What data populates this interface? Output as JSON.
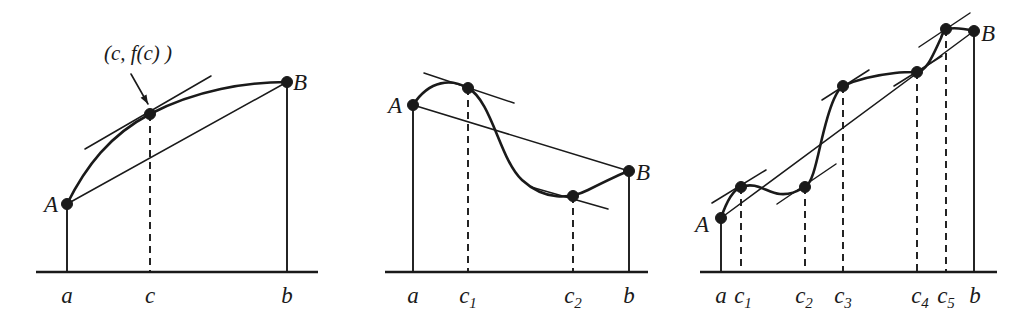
{
  "figure": {
    "background_color": "#ffffff",
    "ink_color": "#1a1a1a",
    "panels": [
      {
        "id": "panel-1",
        "name": "single-tangent-point",
        "annotation": {
          "text": "(c, f(c) )",
          "x": 138,
          "y": 60
        },
        "point_labels": [
          {
            "name": "A",
            "text": "A",
            "x": 51,
            "y": 212
          },
          {
            "name": "B",
            "text": "B",
            "x": 300,
            "y": 90
          }
        ],
        "axis_labels": [
          {
            "name": "a",
            "text": "a",
            "x": 67,
            "y": 303
          },
          {
            "name": "c",
            "text": "c",
            "x": 150,
            "y": 303
          },
          {
            "name": "b",
            "text": "b",
            "x": 287,
            "y": 303
          }
        ],
        "axis": {
          "x1": 36,
          "x2": 318,
          "y": 272
        },
        "verticals": [
          {
            "name": "a",
            "x": 67,
            "y_top": 204,
            "dashed": false
          },
          {
            "name": "c",
            "x": 150,
            "y_top": 114,
            "dashed": true
          },
          {
            "name": "b",
            "x": 287,
            "y_top": 82,
            "dashed": false
          }
        ],
        "points": [
          {
            "name": "A",
            "x": 67,
            "y": 204,
            "r": 5.5
          },
          {
            "name": "tangent-point-c",
            "x": 150,
            "y": 114,
            "r": 5.5
          },
          {
            "name": "B",
            "x": 287,
            "y": 82,
            "r": 5.5
          }
        ],
        "curve": "M 67 204 C 86 166 110 135 150 114 C 196 90 247 82 287 82",
        "secant": {
          "x1": 67,
          "y1": 204,
          "x2": 287,
          "y2": 82
        },
        "tangents": [
          {
            "name": "tangent-at-c",
            "x1": 85,
            "y1": 149,
            "x2": 211,
            "y2": 76
          }
        ],
        "arrow": {
          "x1": 131,
          "y1": 74,
          "x2": 148,
          "y2": 104
        }
      },
      {
        "id": "panel-2",
        "name": "two-tangent-points",
        "point_labels": [
          {
            "name": "A",
            "text": "A",
            "x": 395,
            "y": 113
          },
          {
            "name": "B",
            "text": "B",
            "x": 643,
            "y": 180
          }
        ],
        "axis_labels": [
          {
            "name": "a",
            "text": "a",
            "x": 413,
            "y": 303
          },
          {
            "name": "c1",
            "text": "c",
            "sub": "1",
            "x": 468,
            "y": 303
          },
          {
            "name": "c2",
            "text": "c",
            "sub": "2",
            "x": 573,
            "y": 303
          },
          {
            "name": "b",
            "text": "b",
            "x": 629,
            "y": 303
          }
        ],
        "axis": {
          "x1": 385,
          "x2": 648,
          "y": 272
        },
        "verticals": [
          {
            "name": "a",
            "x": 413,
            "y_top": 105,
            "dashed": false
          },
          {
            "name": "c1",
            "x": 468,
            "y_top": 88,
            "dashed": true
          },
          {
            "name": "c2",
            "x": 573,
            "y_top": 196,
            "dashed": true
          },
          {
            "name": "b",
            "x": 629,
            "y_top": 171,
            "dashed": false
          }
        ],
        "points": [
          {
            "name": "A",
            "x": 413,
            "y": 105,
            "r": 5.5
          },
          {
            "name": "tangent-point-c1",
            "x": 468,
            "y": 88,
            "r": 5.5
          },
          {
            "name": "tangent-point-c2",
            "x": 573,
            "y": 196,
            "r": 5.5
          },
          {
            "name": "B",
            "x": 629,
            "y": 171,
            "r": 5.5
          }
        ],
        "curve": "M 413 105 C 430 79 452 79 468 88 C 492 101 500 160 522 180 C 545 201 570 199 588 190 C 608 180 620 174 629 171",
        "secant": {
          "x1": 413,
          "y1": 105,
          "x2": 629,
          "y2": 171
        },
        "tangents": [
          {
            "name": "tangent-at-c1",
            "x1": 424,
            "y1": 73,
            "x2": 514,
            "y2": 103
          },
          {
            "name": "tangent-at-c2",
            "x1": 531,
            "y1": 187,
            "x2": 608,
            "y2": 209
          }
        ]
      },
      {
        "id": "panel-3",
        "name": "five-tangent-points",
        "point_labels": [
          {
            "name": "A",
            "text": "A",
            "x": 702,
            "y": 232
          },
          {
            "name": "B",
            "text": "B",
            "x": 988,
            "y": 41
          }
        ],
        "axis_labels": [
          {
            "name": "a",
            "text": "a",
            "x": 721,
            "y": 303
          },
          {
            "name": "c1",
            "text": "c",
            "sub": "1",
            "x": 743,
            "y": 303
          },
          {
            "name": "c2",
            "text": "c",
            "sub": "2",
            "x": 804,
            "y": 303
          },
          {
            "name": "c3",
            "text": "c",
            "sub": "3",
            "x": 843,
            "y": 303
          },
          {
            "name": "c4",
            "text": "c",
            "sub": "4",
            "x": 920,
            "y": 303
          },
          {
            "name": "c5",
            "text": "c",
            "sub": "5",
            "x": 946,
            "y": 303
          },
          {
            "name": "b",
            "text": "b",
            "x": 975,
            "y": 303
          }
        ],
        "axis": {
          "x1": 700,
          "x2": 997,
          "y": 272
        },
        "verticals": [
          {
            "name": "a",
            "x": 721,
            "y_top": 218,
            "dashed": false
          },
          {
            "name": "c1",
            "x": 741,
            "y_top": 187,
            "dashed": true
          },
          {
            "name": "c2",
            "x": 805,
            "y_top": 187,
            "dashed": true
          },
          {
            "name": "c3",
            "x": 843,
            "y_top": 86,
            "dashed": true
          },
          {
            "name": "c4",
            "x": 917,
            "y_top": 72,
            "dashed": true
          },
          {
            "name": "c5",
            "x": 946,
            "y_top": 29,
            "dashed": true
          },
          {
            "name": "b",
            "x": 974,
            "y_top": 31,
            "dashed": false
          }
        ],
        "points": [
          {
            "name": "A",
            "x": 721,
            "y": 218,
            "r": 5.5
          },
          {
            "name": "tangent-point-c1",
            "x": 741,
            "y": 187,
            "r": 5.5
          },
          {
            "name": "tangent-point-c2",
            "x": 805,
            "y": 187,
            "r": 5.5
          },
          {
            "name": "tangent-point-c3",
            "x": 843,
            "y": 86,
            "r": 5.5
          },
          {
            "name": "tangent-point-c4",
            "x": 917,
            "y": 72,
            "r": 5.5
          },
          {
            "name": "tangent-point-c5",
            "x": 946,
            "y": 29,
            "r": 5.5
          },
          {
            "name": "B",
            "x": 974,
            "y": 31,
            "r": 5.5
          }
        ],
        "curve": "M 721 218 C 727 200 733 190 741 187 C 757 181 767 193 780 194 C 792 195 799 190 805 187 C 817 181 820 130 834 99 C 838 90 840 88 843 86 C 858 79 877 75 895 73 C 903 72 911 72 917 72 C 927 71 933 55 941 38 C 943 32 944 30 946 29 C 956 27 966 29 974 31",
        "secant": {
          "x1": 721,
          "y1": 218,
          "x2": 974,
          "y2": 31
        },
        "tangents": [
          {
            "name": "tangent-at-c1",
            "x1": 712,
            "y1": 203,
            "x2": 766,
            "y2": 170
          },
          {
            "name": "tangent-at-c2",
            "x1": 777,
            "y1": 204,
            "x2": 836,
            "y2": 164
          },
          {
            "name": "tangent-at-c3",
            "x1": 822,
            "y1": 100,
            "x2": 869,
            "y2": 70
          },
          {
            "name": "tangent-at-c4",
            "x1": 894,
            "y1": 86,
            "x2": 942,
            "y2": 56
          },
          {
            "name": "tangent-at-c5",
            "x1": 919,
            "y1": 47,
            "x2": 970,
            "y2": 13
          }
        ]
      }
    ]
  }
}
